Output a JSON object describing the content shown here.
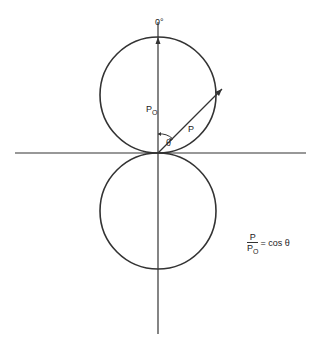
{
  "diagram": {
    "angle_label": "0°",
    "p0_label": "P",
    "p0_sub": "O",
    "p_label": "P",
    "theta_label": "θ",
    "formula": {
      "num": "P",
      "den": "P",
      "den_sub": "O",
      "rhs": "= cos θ"
    }
  }
}
